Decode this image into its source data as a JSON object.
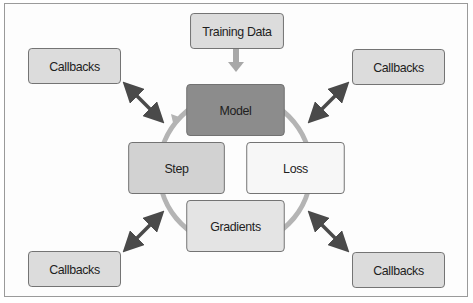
{
  "diagram": {
    "nodes": {
      "training_data": "Training Data",
      "model": "Model",
      "step": "Step",
      "loss": "Loss",
      "gradients": "Gradients",
      "callbacks_top_left": "Callbacks",
      "callbacks_top_right": "Callbacks",
      "callbacks_bottom_left": "Callbacks",
      "callbacks_bottom_right": "Callbacks"
    },
    "edges": [
      {
        "from": "Training Data",
        "to": "Model",
        "type": "arrow"
      },
      {
        "from": "Model",
        "to": "Loss",
        "type": "cycle"
      },
      {
        "from": "Loss",
        "to": "Gradients",
        "type": "cycle"
      },
      {
        "from": "Gradients",
        "to": "Step",
        "type": "cycle"
      },
      {
        "from": "Step",
        "to": "Model",
        "type": "cycle-arrow"
      },
      {
        "from": "Callbacks (top-left)",
        "to": "loop",
        "type": "double-arrow"
      },
      {
        "from": "Callbacks (top-right)",
        "to": "loop",
        "type": "double-arrow"
      },
      {
        "from": "Callbacks (bottom-left)",
        "to": "loop",
        "type": "double-arrow"
      },
      {
        "from": "Callbacks (bottom-right)",
        "to": "loop",
        "type": "double-arrow"
      }
    ],
    "colors": {
      "model_fill": "#8c8c8c",
      "step_fill": "#d2d2d2",
      "loss_fill": "#f7f7f7",
      "gradients_fill": "#e4e4e4",
      "callbacks_fill": "#dcdcdc",
      "cycle_stroke": "#b4b4b4",
      "double_arrow": "#4a4a4a",
      "input_arrow": "#a8a8a8"
    }
  }
}
